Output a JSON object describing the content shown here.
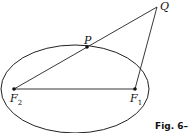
{
  "figure": {
    "caption": "Fig. 6–",
    "points": {
      "Q": {
        "label": "Q",
        "x": 157,
        "y": 7
      },
      "P": {
        "label": "P",
        "x": 87,
        "y": 47
      },
      "F2": {
        "label": "F",
        "sub": "2",
        "x": 14,
        "y": 89
      },
      "F1": {
        "label": "F",
        "sub": "1",
        "x": 135,
        "y": 89
      }
    },
    "ellipse": {
      "cx": 75,
      "cy": 89,
      "rx": 74,
      "ry": 44
    },
    "stroke_color": "#222222"
  }
}
